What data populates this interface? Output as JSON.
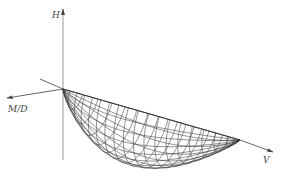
{
  "diagram": {
    "type": "3d-interaction-surface",
    "axes": {
      "vertical": {
        "label": "H"
      },
      "left": {
        "label": "M/D"
      },
      "right": {
        "label": "V"
      }
    },
    "surface": {
      "shape": "ellipsoidal-lobe",
      "meridians": 14,
      "parallels": 18
    }
  }
}
